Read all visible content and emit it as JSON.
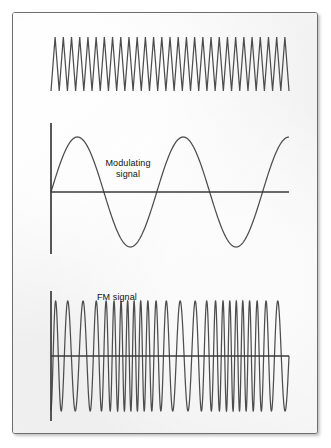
{
  "figure": {
    "title_absent": "",
    "panel": {
      "background_color": "#f4f4f4",
      "border_color": "#6e6e6e",
      "page_background": "#ffffff"
    },
    "stroke_color": "#4d4d4d",
    "axis_color": "#3a3a3a",
    "labels": {
      "modulating": "Modulating\nsignal",
      "fm": "FM signal"
    }
  },
  "chart_data": {
    "type": "line",
    "xlabel": "",
    "ylabel": "",
    "grid": false,
    "legend_position": "inline-annotation",
    "annotations": [
      {
        "text": "Modulating\nsignal",
        "x": 115,
        "y": 155
      },
      {
        "text": "FM signal",
        "x": 120,
        "y": 285
      }
    ],
    "panels": [
      {
        "name": "carrier",
        "waveform": "triangle-carrier",
        "description": "Unmodulated high-frequency carrier, constant amplitude and constant frequency",
        "cycles": 29,
        "amplitude": 27,
        "x_start": 50,
        "x_end": 288,
        "y_center": 63,
        "has_axis": false
      },
      {
        "name": "modulating",
        "waveform": "sine",
        "description": "Low-frequency modulating signal (message), 2.25 cycles shown",
        "cycles": 2.25,
        "amplitude": 55,
        "x_start": 50,
        "x_end": 288,
        "y_center": 191,
        "has_axis": true,
        "axis_vertical": {
          "x": 50,
          "y_top": 122,
          "y_bottom": 253
        },
        "axis_horizontal": {
          "y": 191,
          "x_start": 50,
          "x_end": 288
        },
        "zero_crossings": [
          103,
          155,
          208,
          261
        ]
      },
      {
        "name": "fm",
        "waveform": "fm-sine",
        "description": "Frequency-modulated carrier: frequency rises where modulating signal is low, falls where it is high",
        "carrier_cycles": 26,
        "modulation_index": 0.42,
        "amplitude": 55,
        "x_start": 50,
        "x_end": 288,
        "y_center": 355,
        "has_axis": true,
        "axis_vertical": {
          "x": 50,
          "y_top": 290,
          "y_bottom": 420
        },
        "axis_horizontal": {
          "y": 355,
          "x_start": 50,
          "x_end": 288
        }
      }
    ]
  }
}
